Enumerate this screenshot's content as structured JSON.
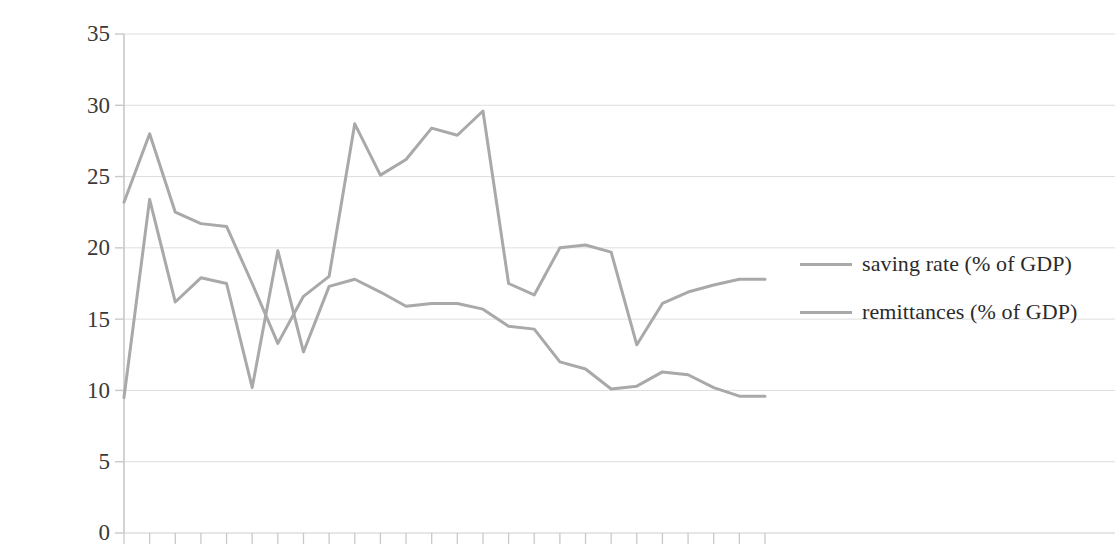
{
  "chart_data": {
    "type": "line",
    "title": "",
    "subtitle": "",
    "xlabel": "",
    "ylabel": "",
    "ylim": [
      0,
      35
    ],
    "yticks": [
      0,
      5,
      10,
      15,
      20,
      25,
      30,
      35
    ],
    "ytick_labels": [
      "0",
      "5",
      "10",
      "15",
      "20",
      "25",
      "30",
      "35"
    ],
    "grid": true,
    "grid_axis": "y",
    "legend_position": "right",
    "x": [
      1,
      2,
      3,
      4,
      5,
      6,
      7,
      8,
      9,
      10,
      11,
      12,
      13,
      14,
      15,
      16,
      17,
      18,
      19,
      20,
      21,
      22,
      23,
      24,
      25,
      26
    ],
    "xtick_labels": [
      "",
      "",
      "",
      "",
      "",
      "",
      "",
      "",
      "",
      "",
      "",
      "",
      "",
      "",
      "",
      "",
      "",
      "",
      "",
      "",
      "",
      "",
      "",
      "",
      "",
      ""
    ],
    "series": [
      {
        "name": "saving rate (% of GDP)",
        "color": "#a9a9a9",
        "values": [
          9.5,
          23.4,
          16.2,
          17.9,
          17.5,
          10.2,
          19.8,
          12.7,
          17.3,
          17.8,
          16.9,
          15.9,
          16.1,
          16.1,
          15.7,
          14.5,
          14.3,
          12.0,
          11.5,
          10.1,
          10.3,
          11.3,
          11.1,
          10.2,
          9.6,
          9.6
        ]
      },
      {
        "name": "remittances (% of GDP)",
        "color": "#a9a9a9",
        "values": [
          23.2,
          28.0,
          22.5,
          21.7,
          21.5,
          17.5,
          13.3,
          16.6,
          18.0,
          28.7,
          25.1,
          26.2,
          28.4,
          27.9,
          29.6,
          17.5,
          16.7,
          20.0,
          20.2,
          19.7,
          13.2,
          16.1,
          16.9,
          17.4,
          17.8,
          17.8
        ]
      }
    ]
  },
  "legend": {
    "items": [
      {
        "label": "saving rate (% of GDP)",
        "color": "#a9a9a9"
      },
      {
        "label": "remittances (% of GDP)",
        "color": "#a9a9a9"
      }
    ]
  },
  "axes": {
    "y_labels": [
      "35",
      "30",
      "25",
      "20",
      "15",
      "10",
      "5",
      "0"
    ],
    "axis_color": "#c9c9c9",
    "grid_color": "#dedede"
  }
}
